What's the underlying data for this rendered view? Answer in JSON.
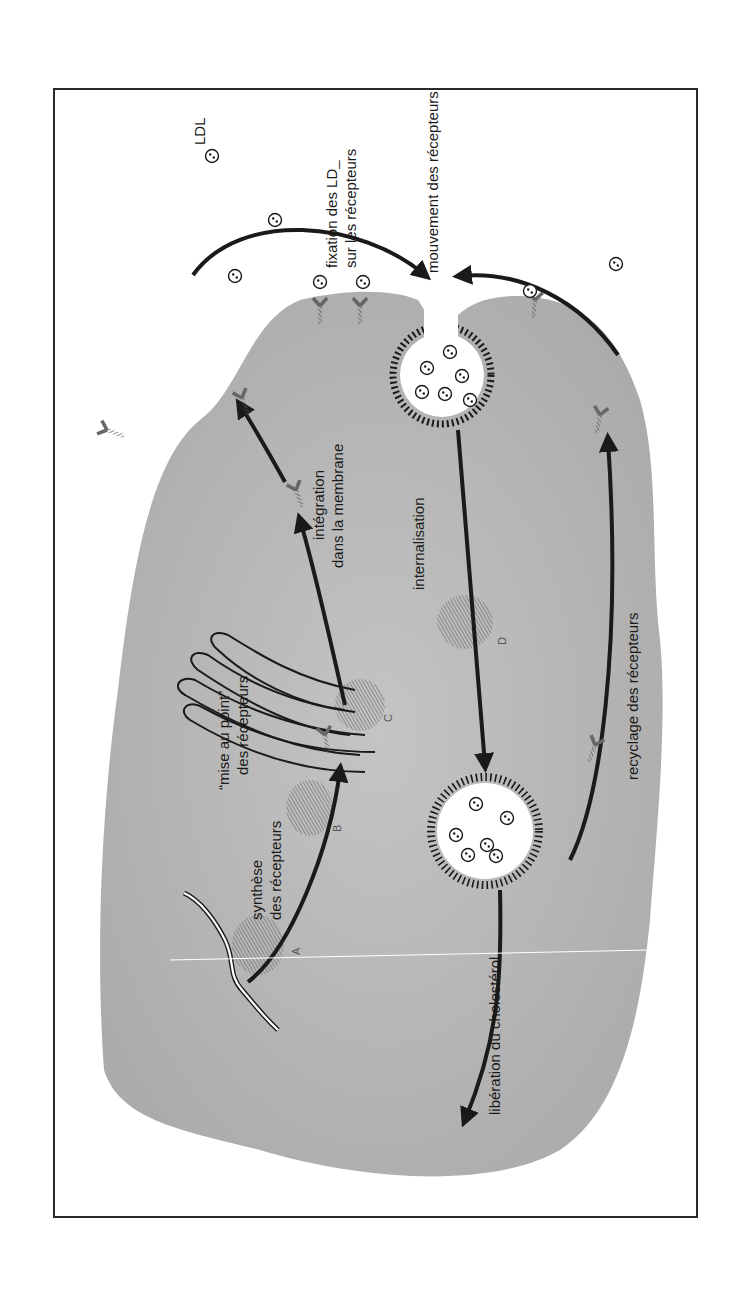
{
  "figure": {
    "orientation": "rotated-90-ccw",
    "background_color": "#ffffff",
    "cell_color": "#b9b9b9",
    "vesicle_fill": "#ffffff",
    "arrow_color": "#1a1a1a",
    "hatch_color": "#6e6e6e"
  },
  "labels": {
    "ldl": "LDL",
    "binding_line1": "fixation des LD_",
    "binding_line2": "sur les récepteurs",
    "movement": "mouvement des récepteurs",
    "integration_line1": "intégration",
    "integration_line2": "dans la membrane",
    "internalisation": "internalisation",
    "maturation_line1": "“mise au point”",
    "maturation_line2": "des récepteurs",
    "synthesis_line1": "synthèse",
    "synthesis_line2": "des récepteurs",
    "release": "libération du cholestérol",
    "recycling": "recyclage des récepteurs"
  },
  "organelle_markers": {
    "a": "A",
    "b": "B",
    "c": "C",
    "d": "D"
  },
  "icons": {
    "ldl_particle": "circle-with-two-dots",
    "receptor": "y-shaped-hatched-receptor",
    "arrow": "curved-arrow"
  }
}
